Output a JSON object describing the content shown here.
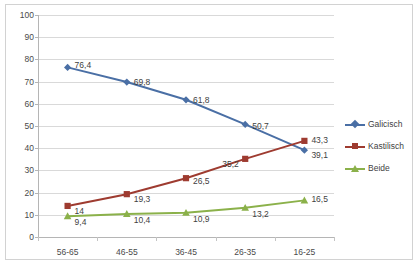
{
  "chart_data": {
    "type": "line",
    "title": "",
    "subtitle": "",
    "xlabel": "",
    "ylabel": "",
    "categories": [
      "56-65",
      "46-55",
      "36-45",
      "26-35",
      "16-25"
    ],
    "ylim": [
      0,
      100
    ],
    "ytick_step": 10,
    "yticks": [
      "0",
      "10",
      "20",
      "30",
      "40",
      "50",
      "60",
      "70",
      "80",
      "90",
      "100"
    ],
    "grid": "horizontal",
    "legend_position": "right",
    "series": [
      {
        "name": "Galicisch",
        "color": "#4A6FA5",
        "marker": "diamond",
        "values": [
          76.4,
          69.8,
          61.8,
          50.7,
          39.1
        ],
        "labels": [
          "76,4",
          "69,8",
          "61,8",
          "50,7",
          "39,1"
        ]
      },
      {
        "name": "Kastilisch",
        "color": "#9E3B30",
        "marker": "square",
        "values": [
          14.0,
          19.3,
          26.5,
          35.2,
          43.3
        ],
        "labels": [
          "14",
          "19,3",
          "26,5",
          "35,2",
          "43,3"
        ]
      },
      {
        "name": "Beide",
        "color": "#8BB14A",
        "marker": "triangle",
        "values": [
          9.4,
          10.4,
          10.9,
          13.2,
          16.5
        ],
        "labels": [
          "9,4",
          "10,4",
          "10,9",
          "13,2",
          "16,5"
        ]
      }
    ]
  },
  "legend": {
    "items": [
      {
        "label": "Galicisch"
      },
      {
        "label": "Kastilisch"
      },
      {
        "label": "Beide"
      }
    ]
  }
}
